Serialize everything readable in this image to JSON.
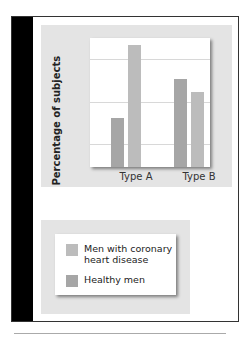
{
  "chart_data": {
    "type": "bar",
    "title": "",
    "xlabel": "",
    "ylabel": "Percentage of subjects",
    "categories": [
      "Type A",
      "Type B"
    ],
    "series": [
      {
        "name": "Healthy men",
        "color": "#a6a6a6",
        "values": [
          29,
          52
        ]
      },
      {
        "name": "Men with coronary heart disease",
        "color": "#bcbcbc",
        "values": [
          72,
          44
        ]
      }
    ],
    "yticks": [
      25,
      50,
      75
    ],
    "ylim": [
      0,
      84
    ],
    "grid": true,
    "legend_position": "below"
  },
  "axis": {
    "ylabel": "Percentage of subjects",
    "ticks": [
      "75",
      "50",
      "25"
    ],
    "categories": [
      "Type A",
      "Type B"
    ]
  },
  "legend": {
    "items": [
      {
        "label": "Men with coronary heart disease",
        "color": "#bcbcbc"
      },
      {
        "label": "Healthy men",
        "color": "#a6a6a6"
      }
    ]
  }
}
